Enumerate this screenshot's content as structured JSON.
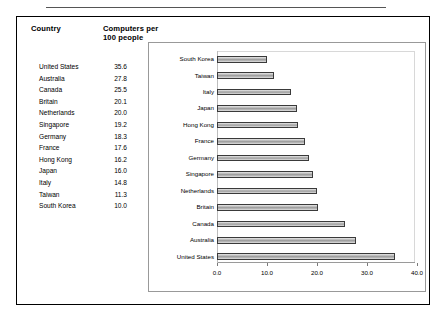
{
  "table": {
    "headers": {
      "country": "Country",
      "value": "Computers per\n100 people"
    },
    "rows": [
      {
        "country": "United States",
        "value": "35.6"
      },
      {
        "country": "Australia",
        "value": "27.8"
      },
      {
        "country": "Canada",
        "value": "25.5"
      },
      {
        "country": "Britain",
        "value": "20.1"
      },
      {
        "country": "Netherlands",
        "value": "20.0"
      },
      {
        "country": "Singapore",
        "value": "19.2"
      },
      {
        "country": "Germany",
        "value": "18.3"
      },
      {
        "country": "France",
        "value": "17.6"
      },
      {
        "country": "Hong Kong",
        "value": "16.2"
      },
      {
        "country": "Japan",
        "value": "16.0"
      },
      {
        "country": "Italy",
        "value": "14.8"
      },
      {
        "country": "Taiwan",
        "value": "11.3"
      },
      {
        "country": "South Korea",
        "value": "10.0"
      }
    ]
  },
  "chart_data": {
    "type": "bar",
    "orientation": "horizontal",
    "title": "",
    "xlabel": "",
    "ylabel": "",
    "categories": [
      "South Korea",
      "Taiwan",
      "Italy",
      "Japan",
      "Hong Kong",
      "France",
      "Germany",
      "Singapore",
      "Netherlands",
      "Britain",
      "Canada",
      "Australia",
      "United States"
    ],
    "values": [
      10.0,
      11.3,
      14.8,
      16.0,
      16.2,
      17.6,
      18.3,
      19.2,
      20.0,
      20.1,
      25.5,
      27.8,
      35.6
    ],
    "xlim": [
      0.0,
      40.0
    ],
    "xticks": [
      0.0,
      10.0,
      20.0,
      30.0,
      40.0
    ],
    "xtick_labels": [
      "0.0",
      "10.0",
      "20.0",
      "30.0",
      "40.0"
    ],
    "grid": false,
    "legend": false,
    "bar_color": "#a8a8a8",
    "bar_edge_color": "#3a3a3a"
  }
}
